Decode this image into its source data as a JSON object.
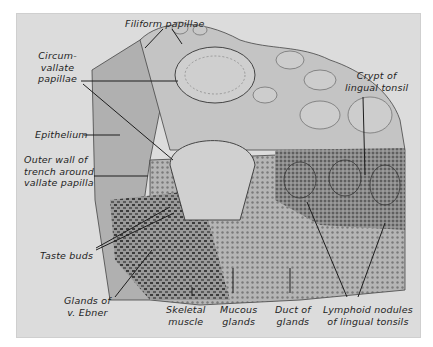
{
  "figure": {
    "background_color": "#dcdcdc",
    "ink_color": "#1e1e1e"
  },
  "labels": {
    "filiform_papillae": "Filiform papillae",
    "circumvallate_papillae": "Circum-\nvallate\npapillae",
    "epithelium": "Epithelium",
    "outer_wall": "Outer wall of\ntrench around\nvallate papilla",
    "taste_buds": "Taste buds",
    "glands_of_v_ebner": "Glands of\nv. Ebner",
    "skeletal_muscle": "Skeletal\nmuscle",
    "mucous_glands": "Mucous\nglands",
    "duct_of_glands": "Duct of\nglands",
    "lymphoid_nodules": "Lymphoid nodules\nof lingual tonsils",
    "crypt_of_lingual_tonsil": "Crypt of\nlingual tonsil"
  }
}
